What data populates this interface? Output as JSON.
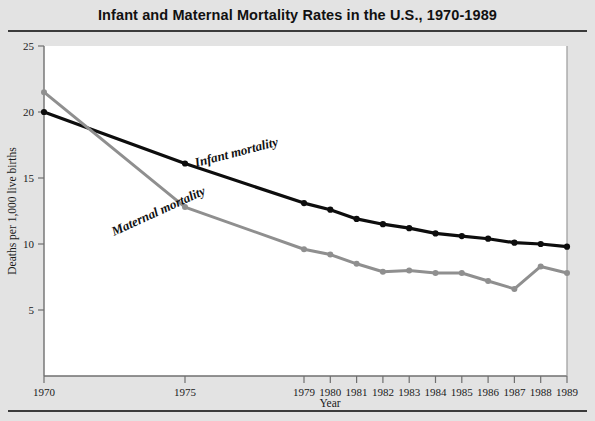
{
  "chart_data": {
    "type": "line",
    "title": "Infant and Maternal Mortality Rates in the U.S., 1970-1989",
    "xlabel": "Year",
    "ylabel": "Deaths per 1,000 live births",
    "x": [
      1970,
      1975,
      1979,
      1980,
      1981,
      1982,
      1983,
      1984,
      1985,
      1986,
      1987,
      1988,
      1989
    ],
    "xtick_labels": [
      "1970",
      "1975",
      "1979",
      "1980",
      "1981",
      "1982",
      "1983",
      "1984",
      "1985",
      "1986",
      "1987",
      "1988",
      "1989"
    ],
    "ytick_labels": [
      "5",
      "10",
      "15",
      "20",
      "25"
    ],
    "ytick_values": [
      5,
      10,
      15,
      20,
      25
    ],
    "ylim": [
      0,
      25
    ],
    "xlim": [
      1970,
      1989
    ],
    "grid": false,
    "legend": "inline-labels",
    "series": [
      {
        "name": "Infant mortality",
        "color": "#0d0d0d",
        "values": [
          20.0,
          16.1,
          13.1,
          12.6,
          11.9,
          11.5,
          11.2,
          10.8,
          10.6,
          10.4,
          10.1,
          10.0,
          9.8
        ]
      },
      {
        "name": "Maternal mortality",
        "color": "#8f8f8f",
        "values": [
          21.5,
          12.8,
          9.6,
          9.2,
          8.5,
          7.9,
          8.0,
          7.8,
          7.8,
          7.2,
          6.6,
          8.3,
          7.8
        ]
      }
    ],
    "annotations": [
      {
        "text": "Infant mortality",
        "near_x": 1976.5,
        "near_y": 15.0
      },
      {
        "text": "Maternal mortality",
        "near_x": 1975.5,
        "near_y": 11.0
      }
    ]
  },
  "colors": {
    "background": "#e3e3e3",
    "plot_background": "#ffffff",
    "rule": "#3b3b3b",
    "axis": "#6f6f6f",
    "infant_series": "#0d0d0d",
    "maternal_series": "#8f8f8f",
    "text": "#1a1a1a"
  }
}
